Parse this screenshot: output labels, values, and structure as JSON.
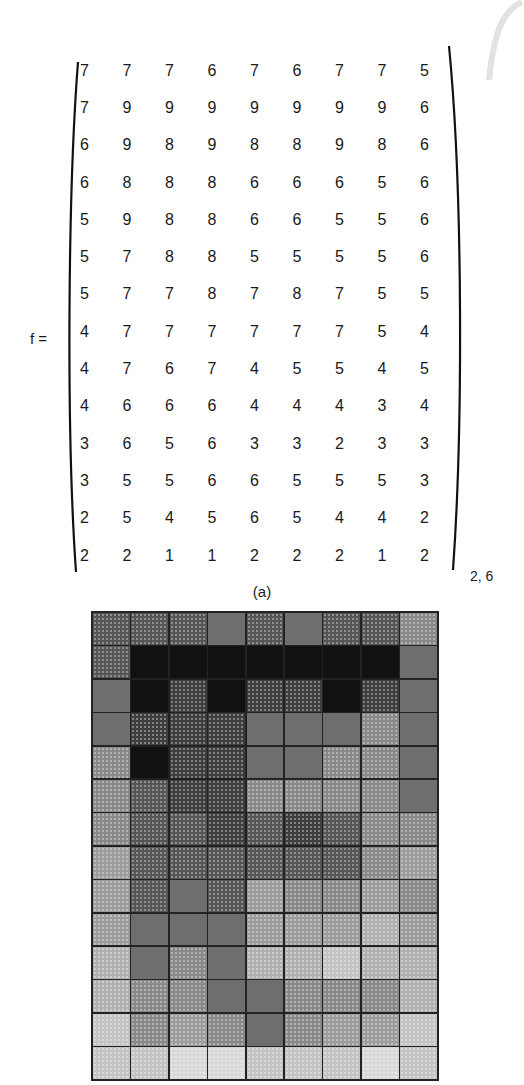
{
  "figure": {
    "matrix_label": "f =",
    "subscript": "2, 6",
    "caption": "(a)",
    "matrix": [
      [
        7,
        7,
        7,
        6,
        7,
        6,
        7,
        7,
        5
      ],
      [
        7,
        9,
        9,
        9,
        9,
        9,
        9,
        9,
        6
      ],
      [
        6,
        9,
        8,
        9,
        8,
        8,
        9,
        8,
        6
      ],
      [
        6,
        8,
        8,
        8,
        6,
        6,
        6,
        5,
        6
      ],
      [
        5,
        9,
        8,
        8,
        6,
        6,
        5,
        5,
        6
      ],
      [
        5,
        7,
        8,
        8,
        5,
        5,
        5,
        5,
        6
      ],
      [
        5,
        7,
        7,
        8,
        7,
        8,
        7,
        5,
        5
      ],
      [
        4,
        7,
        7,
        7,
        7,
        7,
        7,
        5,
        4
      ],
      [
        4,
        7,
        6,
        7,
        4,
        5,
        5,
        4,
        5
      ],
      [
        4,
        6,
        6,
        6,
        4,
        4,
        4,
        3,
        4
      ],
      [
        3,
        6,
        5,
        6,
        3,
        3,
        2,
        3,
        3
      ],
      [
        3,
        5,
        5,
        6,
        6,
        5,
        5,
        5,
        3
      ],
      [
        2,
        5,
        4,
        5,
        6,
        5,
        4,
        4,
        2
      ],
      [
        2,
        2,
        1,
        1,
        2,
        2,
        2,
        1,
        2
      ]
    ],
    "gray_levels": {
      "1": "#d8d8d8",
      "2": "#c4c4c4",
      "3": "#b0b0b0",
      "4": "#9c9c9c",
      "5": "#888888",
      "6": "#6e6e6e",
      "7": "#555555",
      "8": "#3e3e3e",
      "9": "#111111"
    },
    "solid_values": [
      9,
      8,
      6
    ]
  }
}
